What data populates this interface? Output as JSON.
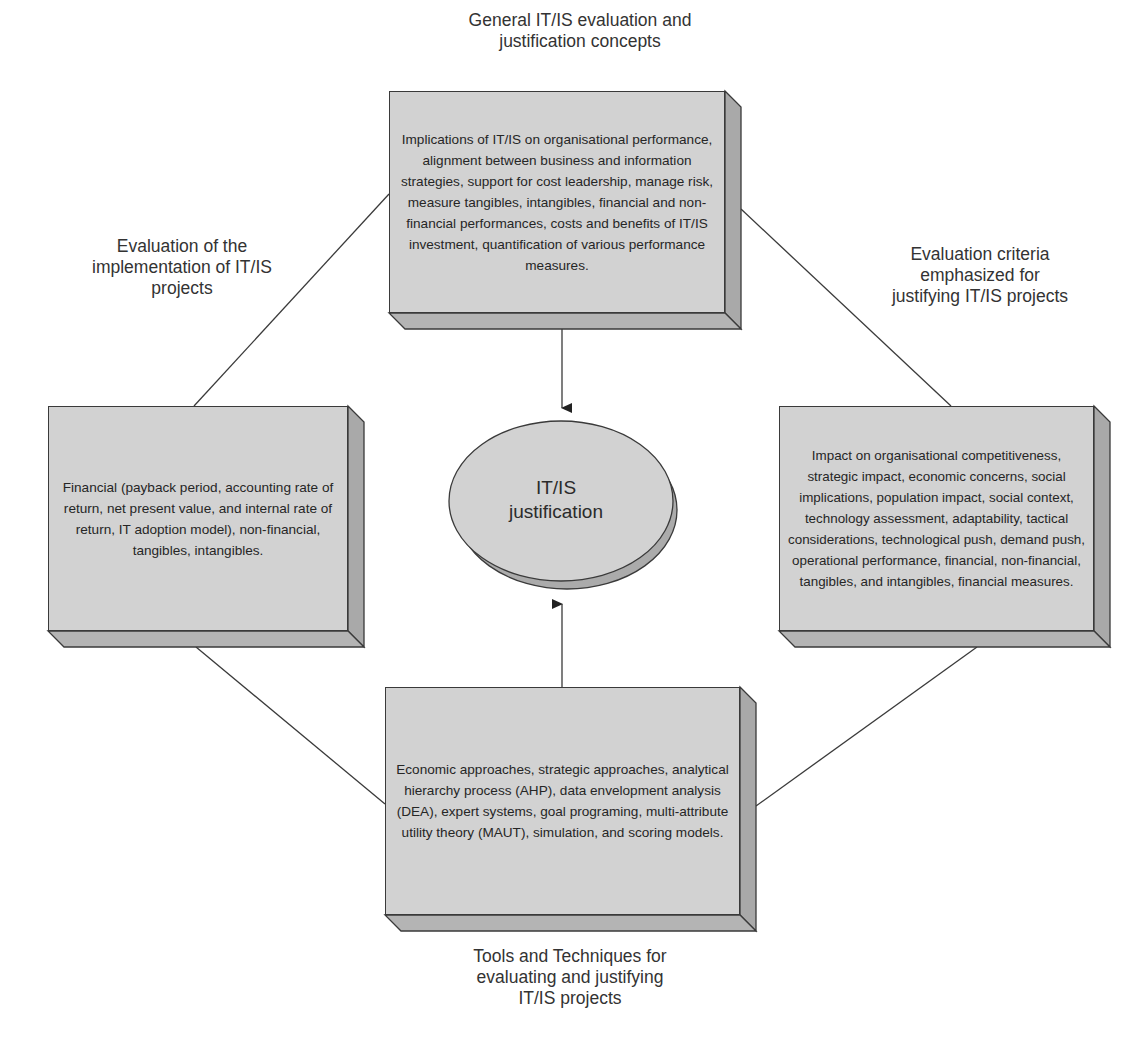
{
  "diagram": {
    "center": {
      "line1": "IT/IS",
      "line2": "justification"
    },
    "top": {
      "title": [
        "General IT/IS evaluation and",
        "justification concepts"
      ],
      "body": "Implications of IT/IS on organisational performance, alignment between business and information strategies, support for cost leadership, manage risk, measure tangibles, intangibles, financial and non-financial performances, costs and benefits of IT/IS investment, quantification of various performance measures."
    },
    "left": {
      "title": [
        "Evaluation of the",
        "implementation of IT/IS",
        "projects"
      ],
      "body": "Financial (payback period, accounting rate of return, net present value, and internal rate of return, IT adoption model), non-financial, tangibles, intangibles."
    },
    "right": {
      "title": [
        "Evaluation criteria",
        "emphasized for",
        "justifying IT/IS projects"
      ],
      "body": "Impact on organisational competitiveness, strategic impact, economic concerns, social implications, population impact, social context, technology assessment, adaptability, tactical considerations, technological push, demand push, operational performance, financial, non-financial, tangibles, and intangibles, financial measures."
    },
    "bottom": {
      "title": [
        "Tools and Techniques for",
        "evaluating and justifying",
        "IT/IS projects"
      ],
      "body": "Economic approaches, strategic approaches, analytical hierarchy process (AHP), data envelopment analysis (DEA), expert systems, goal programing, multi-attribute utility theory (MAUT), simulation, and scoring models."
    },
    "colors": {
      "box_face": "#d2d2d2",
      "box_side": "#a9a9a9",
      "box_bottom": "#b4b4b4",
      "line": "#3a3a3a"
    }
  }
}
